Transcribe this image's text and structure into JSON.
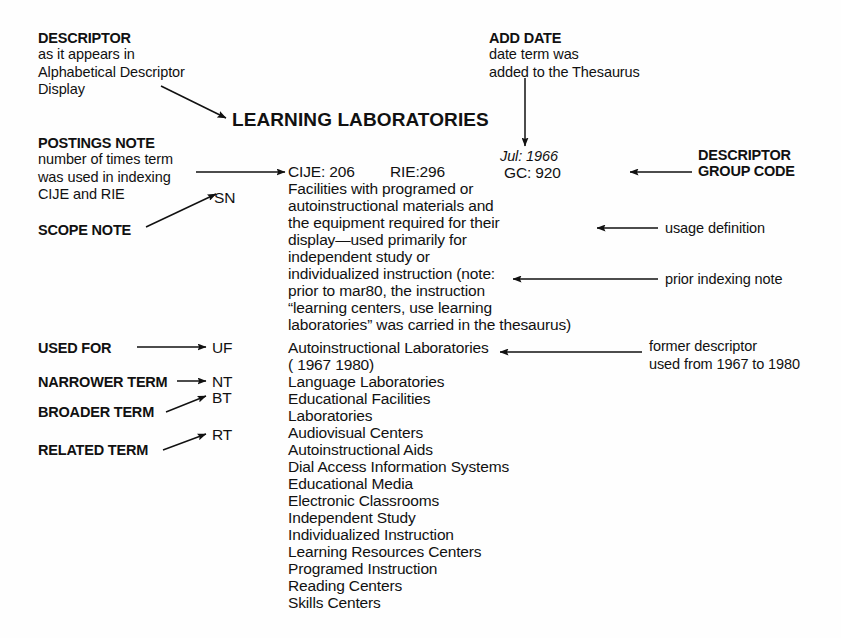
{
  "page": {
    "background": "#fefefe",
    "ink": "#111111"
  },
  "annotations": {
    "descriptor": {
      "head": "DESCRIPTOR",
      "lines": [
        "as it appears in",
        "Alphabetical Descriptor",
        "Display"
      ]
    },
    "postings_note": {
      "head": "POSTINGS NOTE",
      "lines": [
        "number of times term",
        "was used in indexing",
        "CIJE and RIE"
      ]
    },
    "scope_note": {
      "head": "SCOPE NOTE"
    },
    "add_date": {
      "head": "ADD DATE",
      "lines": [
        "date term was",
        "added to the Thesaurus"
      ]
    },
    "descriptor_group_code": {
      "head_line1": "DESCRIPTOR",
      "head_line2": "GROUP CODE"
    },
    "used_for": {
      "head": "USED FOR"
    },
    "narrower_term": {
      "head": "NARROWER TERM"
    },
    "broader_term": {
      "head": "BROADER TERM"
    },
    "related_term": {
      "head": "RELATED TERM"
    },
    "usage_definition": {
      "label": "usage definition"
    },
    "prior_indexing_note": {
      "label": "prior indexing note"
    },
    "former_descriptor": {
      "line1": "former descriptor",
      "line2": "used from 1967 to 1980"
    }
  },
  "record": {
    "title": "LEARNING LABORATORIES",
    "postings": {
      "cije": "CIJE: 206",
      "rie": "RIE:296"
    },
    "add_date": "Jul: 1966",
    "group_code": "GC: 920",
    "tags": {
      "sn": "SN",
      "uf": "UF",
      "nt": "NT",
      "bt": "BT",
      "rt": "RT"
    },
    "scope_note_lines": [
      "Facilities with programed or",
      "autoinstructional materials and",
      "the equipment required for their",
      "display—used primarily for",
      "independent study or",
      "individualized instruction (note:",
      "prior to mar80, the instruction",
      "“learning centers, use learning",
      "laboratories” was carried in the thesaurus)"
    ],
    "used_for_terms": [
      "Autoinstructional Laboratories",
      "( 1967 1980)"
    ],
    "narrower_terms": [
      "Language Laboratories"
    ],
    "broader_terms": [
      "Educational Facilities",
      "Laboratories"
    ],
    "related_terms": [
      "Audiovisual Centers",
      "Autoinstructional Aids",
      "Dial Access Information Systems",
      "Educational Media",
      "Electronic Classrooms",
      "Independent Study",
      "Individualized Instruction",
      "Learning Resources Centers",
      "Programed Instruction",
      "Reading Centers",
      "Skills Centers"
    ]
  }
}
